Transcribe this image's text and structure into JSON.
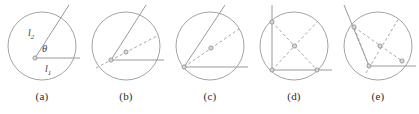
{
  "figure": {
    "background_color": "#ffffff",
    "stroke_color": "#9a9a9a",
    "circle_color": "#9a9a9a",
    "dashed_color": "#a8a8a8",
    "marker_fill": "#d8d8d8",
    "marker_stroke": "#8a8a8a",
    "label_color": "#3a3a3a",
    "panel_count": 5
  },
  "panels": [
    {
      "caption": "(a)",
      "labels": {
        "ray_upper": "l",
        "ray_upper_sub": "2",
        "ray_lower": "l",
        "ray_lower_sub": "1",
        "angle": "θ"
      },
      "description": "Vertex at circle center; two solid rays l1 horizontal and l2 oblique forming angle theta",
      "vertex_markers": 1,
      "dashed_chords": 0
    },
    {
      "caption": "(b)",
      "labels": {},
      "description": "Vertex inside circle below center; solid rays plus one dashed chord through interior point",
      "vertex_markers": 2,
      "dashed_chords": 1
    },
    {
      "caption": "(c)",
      "labels": {},
      "description": "Vertex on circle at lower left; solid rays plus dashed chord to center point",
      "vertex_markers": 2,
      "dashed_chords": 1
    },
    {
      "caption": "(d)",
      "labels": {},
      "description": "Inscribed rectangle with solid left and bottom sides and two dashed diagonals crossing at center",
      "vertex_markers": 4,
      "dashed_chords": 2
    },
    {
      "caption": "(e)",
      "labels": {},
      "description": "Vertex on circle with solid oblique ray and horizontal ray plus dashed chords meeting at center",
      "vertex_markers": 3,
      "dashed_chords": 3
    }
  ]
}
